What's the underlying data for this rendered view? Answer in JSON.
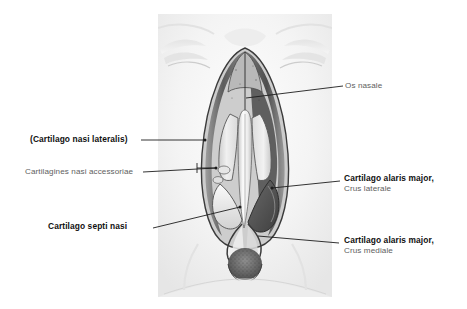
{
  "figure": {
    "style": "grayscale halftone medical illustration"
  },
  "labels": [
    {
      "id": "os-nasale",
      "line1": "Os nasale",
      "line2": "",
      "weight": "regular",
      "side": "right"
    },
    {
      "id": "cartilago-nasi-lateralis",
      "line1": "(Cartilago nasi lateralis)",
      "line2": "",
      "weight": "bold",
      "side": "left"
    },
    {
      "id": "cartilagines-nasi-accessoriae",
      "line1": "Cartilagines nasi accessoriae",
      "line2": "",
      "weight": "regular",
      "side": "left"
    },
    {
      "id": "cartilago-septi-nasi",
      "line1": "Cartilago septi nasi",
      "line2": "",
      "weight": "bold",
      "side": "left"
    },
    {
      "id": "cartilago-alaris-major-crus-laterale",
      "line1": "Cartilago alaris major,",
      "line2": "Crus laterale",
      "weight": "bold",
      "side": "right"
    },
    {
      "id": "cartilago-alaris-major-crus-mediale",
      "line1": "Cartilago alaris major,",
      "line2": "Crus mediale",
      "weight": "bold",
      "side": "right"
    }
  ],
  "colors": {
    "background": "#ffffff",
    "label_bold": "#101010",
    "label_regular": "#5e5e5e",
    "leader_line": "#1d1d1d",
    "plate_base": "#f2f2f2"
  }
}
